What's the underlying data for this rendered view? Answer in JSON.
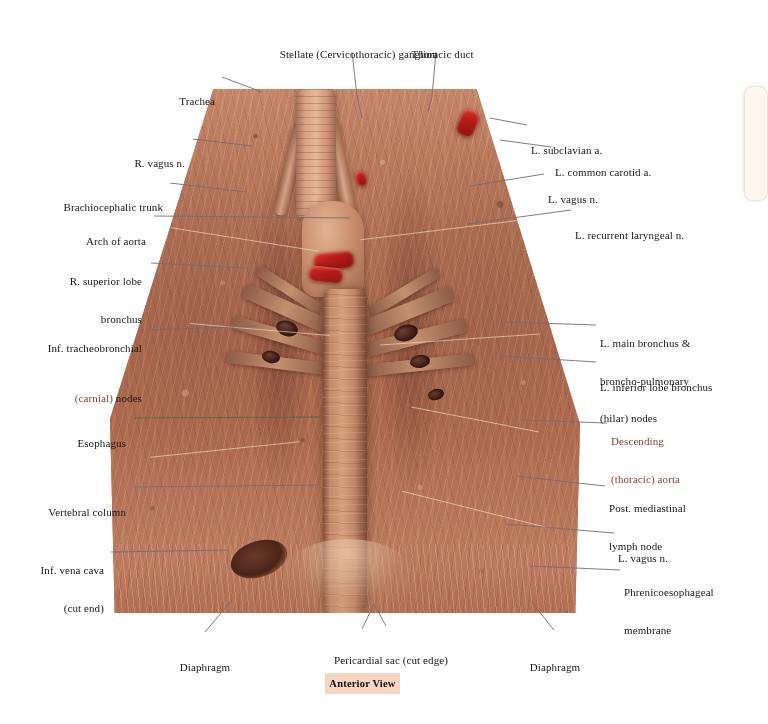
{
  "plate": {
    "caption": "Anterior View",
    "view_label_bg": "#f6d6c3"
  },
  "colors": {
    "label_text": "#16161a",
    "label_red": "#8c3a36",
    "label_green": "#3f5f3c",
    "leader_line": "#6e6e74",
    "page_bg": "#ffffff",
    "side_panel": "#fdf7ef",
    "tissue_base": "#ab6a50",
    "injected_artery": "#b21c18"
  },
  "labels": {
    "top": [
      {
        "id": "stellate-ganglion",
        "text": "Stellate (Cervicothoracic) ganglion",
        "align": "center"
      },
      {
        "id": "thoracic-duct",
        "text": "Thoracic duct",
        "align": "center"
      }
    ],
    "left": [
      {
        "id": "trachea",
        "lines": [
          "Trachea"
        ]
      },
      {
        "id": "r-vagus-n",
        "lines": [
          "R. vagus n."
        ]
      },
      {
        "id": "brachiocephalic-trunk",
        "lines": [
          "Brachiocephalic trunk"
        ]
      },
      {
        "id": "arch-of-aorta",
        "lines": [
          "Arch of aorta"
        ]
      },
      {
        "id": "r-superior-lobe-bronchus",
        "lines": [
          "R. superior lobe",
          "bronchus"
        ]
      },
      {
        "id": "inf-tracheobronchial-nodes",
        "lines": [
          "Inf. tracheobronchial",
          "(carnial) nodes"
        ],
        "accent_line": 1,
        "accent": "red",
        "accent_word": "(carnial)"
      },
      {
        "id": "esophagus",
        "lines": [
          "Esophagus"
        ],
        "leader_color": "#4a6b47"
      },
      {
        "id": "vertebral-column",
        "lines": [
          "Vertebral column"
        ]
      },
      {
        "id": "inf-vena-cava",
        "lines": [
          "Inf. vena cava",
          "(cut end)"
        ]
      }
    ],
    "right": [
      {
        "id": "l-subclavian-a",
        "lines": [
          "L. subclavian a."
        ]
      },
      {
        "id": "l-common-carotid-a",
        "lines": [
          "L. common carotid a."
        ]
      },
      {
        "id": "l-vagus-n-upper",
        "lines": [
          "L. vagus n."
        ]
      },
      {
        "id": "l-recurrent-laryngeal-n",
        "lines": [
          "L. recurrent laryngeal n."
        ]
      },
      {
        "id": "l-main-bronchus-hilar-nodes",
        "lines": [
          "L. main bronchus &",
          "broncho-pulmonary",
          "(hilar) nodes"
        ]
      },
      {
        "id": "l-inferior-lobe-bronchus",
        "lines": [
          "L. inferior lobe bronchus"
        ]
      },
      {
        "id": "descending-thoracic-aorta",
        "lines": [
          "Descending",
          "(thoracic) aorta"
        ],
        "accent": "red"
      },
      {
        "id": "post-mediastinal-lymph-node",
        "lines": [
          "Post. mediastinal",
          "lymph node"
        ]
      },
      {
        "id": "l-vagus-n-lower",
        "lines": [
          "L. vagus n."
        ]
      },
      {
        "id": "phrenicoesophageal-membrane",
        "lines": [
          "Phrenicoesophageal",
          "membrane"
        ]
      }
    ],
    "bottom": [
      {
        "id": "diaphragm-left",
        "lines": [
          "Diaphragm"
        ]
      },
      {
        "id": "pericardial-sac",
        "lines": [
          "Pericardial sac (cut edge)"
        ]
      },
      {
        "id": "diaphragm-right",
        "lines": [
          "Diaphragm"
        ]
      }
    ]
  }
}
